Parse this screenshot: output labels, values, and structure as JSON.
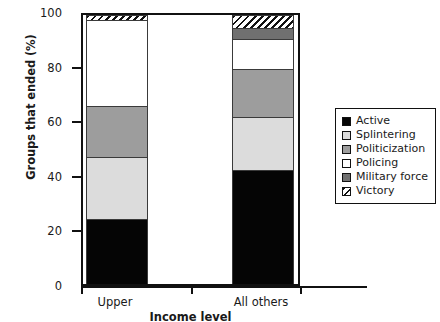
{
  "chart_data": {
    "type": "bar",
    "subtype": "stacked-bar-100",
    "title": "",
    "xlabel": "Income level",
    "ylabel": "Groups that ended (%)",
    "categories": [
      "Upper",
      "All others"
    ],
    "ylim": [
      0,
      100
    ],
    "yticks": [
      0,
      20,
      40,
      60,
      80,
      100
    ],
    "ytick_labels": [
      "0",
      "20",
      "40",
      "60",
      "80",
      "100"
    ],
    "grid": false,
    "legend_position": "right",
    "series": [
      {
        "name": "Active",
        "values": [
          24.0,
          42.5
        ],
        "color": "#050505",
        "pattern": "solid"
      },
      {
        "name": "Splintering",
        "values": [
          23.3,
          19.5
        ],
        "color": "#dcdcdc",
        "pattern": "solid"
      },
      {
        "name": "Politicization",
        "values": [
          19.0,
          18.0
        ],
        "color": "#9d9d9d",
        "pattern": "solid"
      },
      {
        "name": "Policing",
        "values": [
          31.7,
          11.0
        ],
        "color": "#ffffff",
        "pattern": "solid"
      },
      {
        "name": "Military force",
        "values": [
          0.0,
          4.0
        ],
        "color": "#707070",
        "pattern": "solid"
      },
      {
        "name": "Victory",
        "values": [
          2.0,
          5.0
        ],
        "color": "#ffffff",
        "pattern": "diagonal-hatch"
      }
    ]
  },
  "axes": {
    "y": {
      "label": "Groups that ended (%)",
      "ticks": [
        {
          "value": 100,
          "label": "100"
        },
        {
          "value": 80,
          "label": "80"
        },
        {
          "value": 60,
          "label": "60"
        },
        {
          "value": 40,
          "label": "40"
        },
        {
          "value": 20,
          "label": "20"
        },
        {
          "value": 0,
          "label": "0"
        }
      ]
    },
    "x": {
      "label": "Income level",
      "ticks": [
        {
          "label": "Upper"
        },
        {
          "label": "All others"
        }
      ]
    }
  },
  "legend": {
    "items": [
      {
        "label": "Active"
      },
      {
        "label": "Splintering"
      },
      {
        "label": "Politicization"
      },
      {
        "label": "Policing"
      },
      {
        "label": "Military force"
      },
      {
        "label": "Victory"
      }
    ]
  }
}
